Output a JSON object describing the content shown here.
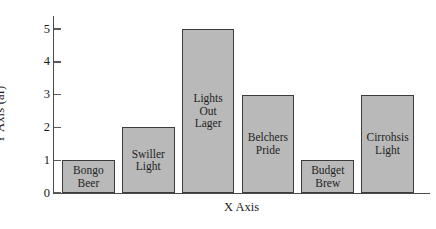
{
  "chart_data": {
    "type": "bar",
    "title": "",
    "xlabel": "X Axis",
    "ylabel": "Y Axis (af)",
    "categories": [
      "Bongo Beer",
      "Swiller Light",
      "Lights Out Lager",
      "Belchers Pride",
      "Budget Brew",
      "Cirrohsis Light"
    ],
    "values": [
      1,
      2,
      5,
      3,
      1,
      3
    ],
    "bar_labels": [
      "Bongo\nBeer",
      "Swiller\nLight",
      "Lights\nOut\nLager",
      "Belchers\nPride",
      "Budget\nBrew",
      "Cirrohsis\nLight"
    ],
    "ylim": [
      0,
      5.4
    ],
    "yticks": [
      0,
      1,
      2,
      3,
      4,
      5
    ],
    "ytick_labels": [
      "0",
      "1",
      "2",
      "3",
      "4",
      "5"
    ],
    "grid": false,
    "legend": false,
    "bar_fill_color": "#b9b9b9",
    "bar_edge_color": "#3c3c3c",
    "axis_color": "#4a4a4a",
    "background_color": "#ffffff"
  }
}
